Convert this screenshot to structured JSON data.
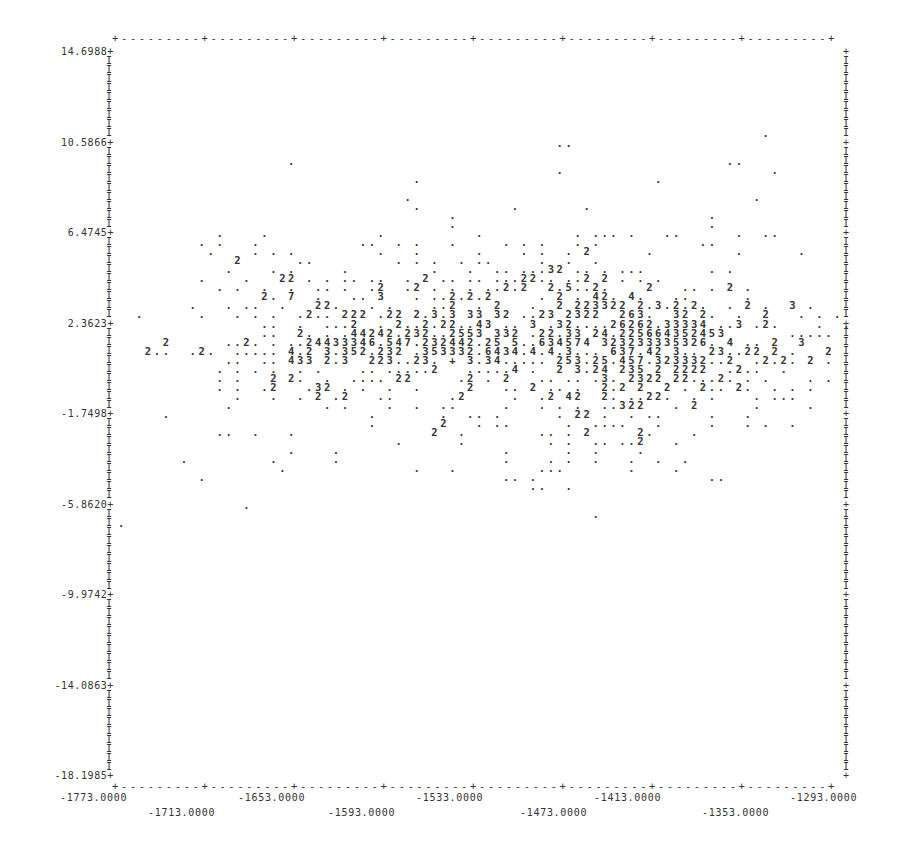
{
  "chart_data": {
    "type": "scatter",
    "title": "",
    "xlabel": "",
    "ylabel": "",
    "xlim": [
      -1773.0,
      -1293.0
    ],
    "ylim": [
      -18.1985,
      14.6988
    ],
    "grid": false,
    "legend": "none",
    "x_ticks": [
      "-1773.0000",
      "-1713.0000",
      "-1653.0000",
      "-1593.0000",
      "-1533.0000",
      "-1473.0000",
      "-1413.0000",
      "-1353.0000",
      "-1293.0000"
    ],
    "y_ticks": [
      "14.6988",
      "10.5866",
      "6.4745",
      "2.3623",
      "-1.7498",
      "-5.8620",
      "-9.9742",
      "-14.0863",
      "-18.1985"
    ]
  },
  "y_axis": {
    "labels": [
      {
        "text": "14.6988+",
        "row": 0
      },
      {
        "text": "10.5866+",
        "row": 10
      },
      {
        "text": "6.4745+",
        "row": 20
      },
      {
        "text": "2.3623+",
        "row": 30
      },
      {
        "text": "-1.7498+",
        "row": 40
      },
      {
        "text": "-5.8620+",
        "row": 50
      },
      {
        "text": "-9.9742+",
        "row": 60
      },
      {
        "text": "-14.0863+",
        "row": 70
      },
      {
        "text": "-18.1985+",
        "row": 80
      }
    ]
  },
  "x_axis": {
    "labels_upper": [
      {
        "text": "-1773.0000",
        "x": 60
      },
      {
        "text": "-1653.0000",
        "x": 238
      },
      {
        "text": "-1533.0000",
        "x": 416
      },
      {
        "text": "-1413.0000",
        "x": 594
      },
      {
        "text": "-1293.0000",
        "x": 790
      }
    ],
    "labels_lower": [
      {
        "text": "-1713.0000",
        "x": 148
      },
      {
        "text": "-1593.0000",
        "x": 328
      },
      {
        "text": "-1473.0000",
        "x": 520
      },
      {
        "text": "-1353.0000",
        "x": 702
      }
    ]
  },
  "border": {
    "top": "+---------+---------+---------+---------+---------+---------+---------+---------+",
    "bottom": "+---------+---------+---------+---------+---------+---------+---------+---------+"
  },
  "rows": [
    "                                                                        .        ",
    "                                                 ..                               ",
    "                                                                                 ",
    "                   .                                                ..           ",
    "                                                 .                       .       ",
    "                                 .                          .                    ",
    "                                                                                 ",
    "                                .                                      .         ",
    "                                 .          .       .                            ",
    "                                     .                            .              ",
    "                                     .                            .              ",
    "           .    .            .          .          . ... .   ..      .  ..       ",
    "         . .   .           ..  . .   .     . . .   . .           ..              ",
    "          .    . . .         .   .      .    . .  . 2      .         .      .    ",
    "             2      ..         . . .  . ..     .  .  .                           ",
    "            .    . .     .         .   .  .. ...32 .. . ...       . .            ",
    "         .    .   22 . . .. ..  . 2 .. .. ...22.. ..2 2 . . .                   ",
    "           . .  .  .  .. .  .2  .2 . . . ..2.2  2.5..2.    2   .. . 2 .         ",
    "                2. 7  .   .. 3   . ..2.2.2     . 2 . 42. 4.   ..      .         ",
    "        .   . ..  .   22.   . .    ..2  . 2   .  2 223322 2.3.2.2.  . 2 .  3 .   ",
    "  .      .   . . .  .2.. 222 .22 2.3.3 33 32 ..23 2322  263.  32 2.  .  2   . . .",
    "                ..  .  ...2  . 2..2.22..43 .. 3 .32....26262.33334 ..3 .2.    .  .",
    "                ..  2. . .44242.232..2553 332 .22.33 24.225664352453       .....  ",
    "     2      ..2. . ..24433346.547.232442.25 5..634574 323233335326. 4 .. 2  3     ",
    "   2..  .2.  ..... 4.2 3.352.232 .353332.6434.4.4.3... 637.42 3.. 23..22 2 .   2  ",
    "            ..  .. 433 2.3  223..23. + 3.34..... 253.25.457.323332..2  .2.2. 2 .  ",
    "           . . . .  . .    .. .....2   .....4 .  2 3.24 235 2 2222  .2..  .       ",
    "           . .   2 2.  .  .... 22     .2 . 2   .. .. .3. 2322 22...2. . .    . .  ",
    "           . .  .2   .32 . .  .  .     2   .. 2 .. .  2.2 2  2 . 2.. 2.  . . .    ",
    "             .   .  . 2 .2   ..      .2     .  .2 42  2. ..22.  . .    . ...      ",
    "            .          . .    .  .  ..     .   . . .  ..322   . 2      .     .    ",
    "     .                      .       .  .. .      . 22 .  . ..     .   .          ",
    "                            .       2   . ..      .  ....   .     .   . .  .     ",
    "           ..  .   .               2  .        .. . 2     2.    .                 ",
    "                               .      .         . .  .. ..2   .                   ",
    "                   .    .                  .      .  .    .                      ",
    "       .         .      .                  .    . .  .   .  .  .                 ",
    "                  .              .   .         ...       .    .                  ",
    "         .                                 .. .                   ..             ",
    "                                              ..  .                               ",
    "                                                                                 ",
    "              .                                                                  ",
    "                                                     .                           ",
    ".                                                                                "
  ]
}
